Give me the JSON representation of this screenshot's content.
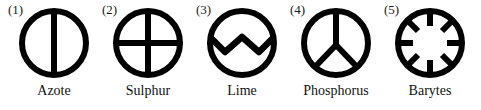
{
  "figure": {
    "background_color": "#ffffff",
    "ink_color": "#000000",
    "width": 481,
    "height": 110
  },
  "symbols": [
    {
      "index_label": "(1)",
      "name": "Azote",
      "glyph": "circle-with-vertical-bar",
      "left": 6,
      "label_left_offset": 2
    },
    {
      "index_label": "(2)",
      "name": "Sulphur",
      "glyph": "circle-with-cross",
      "left": 100,
      "label_left_offset": 2
    },
    {
      "index_label": "(3)",
      "name": "Lime",
      "glyph": "circle-with-zigzag",
      "left": 194,
      "label_left_offset": 2
    },
    {
      "index_label": "(4)",
      "name": "Phosphorus",
      "glyph": "circle-with-peace-fork",
      "left": 288,
      "label_left_offset": 2
    },
    {
      "index_label": "(5)",
      "name": "Barytes",
      "glyph": "circle-with-eight-inward-spokes",
      "left": 382,
      "label_left_offset": 2
    }
  ]
}
